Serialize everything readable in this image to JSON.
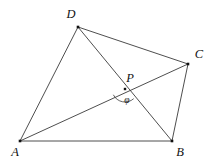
{
  "figure": {
    "type": "geometry-diagram",
    "width": 218,
    "height": 165,
    "background_color": "#ffffff",
    "line_color": "#3a3a3a",
    "point_color": "#111111",
    "label_color": "#111111"
  },
  "points": [
    {
      "id": "A",
      "label": "A",
      "x": 20,
      "y": 141,
      "label_x": 15,
      "label_y": 153,
      "dot_size": 2.6
    },
    {
      "id": "B",
      "label": "B",
      "x": 172,
      "y": 141,
      "label_x": 180,
      "label_y": 153,
      "dot_size": 2.6
    },
    {
      "id": "C",
      "label": "C",
      "x": 188,
      "y": 64,
      "label_x": 199,
      "label_y": 55,
      "dot_size": 2.6
    },
    {
      "id": "D",
      "label": "D",
      "x": 78,
      "y": 27,
      "label_x": 71,
      "label_y": 15,
      "dot_size": 2.6
    },
    {
      "id": "P",
      "label": "P",
      "x": 125,
      "y": 89,
      "label_x": 130,
      "label_y": 79,
      "dot_size": 2.4
    }
  ],
  "segments": [
    {
      "id": "AB",
      "from": "A",
      "to": "B",
      "kind": "edge"
    },
    {
      "id": "BC",
      "from": "B",
      "to": "C",
      "kind": "edge"
    },
    {
      "id": "CD",
      "from": "C",
      "to": "D",
      "kind": "edge"
    },
    {
      "id": "DA",
      "from": "D",
      "to": "A",
      "kind": "edge"
    },
    {
      "id": "AC",
      "from": "A",
      "to": "C",
      "kind": "diagonal"
    },
    {
      "id": "DB",
      "from": "D",
      "to": "B",
      "kind": "diagonal"
    }
  ],
  "angle_marks": [
    {
      "id": "phi-at-P",
      "label": "φ",
      "vertex": "P",
      "ray_start": "A",
      "ray_end": "B",
      "radius": 13,
      "label_x": 127,
      "label_y": 101
    }
  ]
}
